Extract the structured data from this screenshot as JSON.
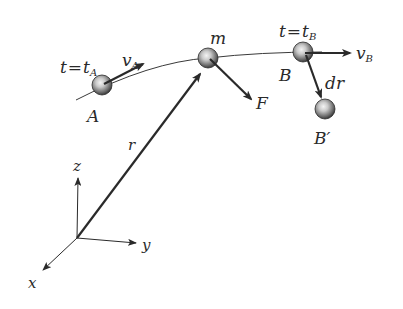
{
  "diagram": {
    "type": "particle-trajectory",
    "colors": {
      "background": "#ffffff",
      "ink": "#2a2a2a",
      "ball_dark": "#3a3a3a",
      "ball_light": "#e8e8e8"
    },
    "labels": {
      "time_a_lhs": "t",
      "time_a_eq": "=",
      "time_a_rhs": "t",
      "time_a_sub": "A",
      "velocity_a": "v",
      "velocity_a_sub": "A",
      "point_a": "A",
      "mass": "m",
      "force": "F",
      "time_b_lhs": "t",
      "time_b_eq": "=",
      "time_b_rhs": "t",
      "time_b_sub": "B",
      "velocity_b": "v",
      "velocity_b_sub": "B",
      "point_b": "B",
      "displacement": "dr",
      "point_b_prime": "B′",
      "position_vector": "r",
      "axis_x": "x",
      "axis_y": "y",
      "axis_z": "z"
    },
    "points": [
      {
        "name": "A",
        "x": 102,
        "y": 85
      },
      {
        "name": "m",
        "x": 208,
        "y": 58
      },
      {
        "name": "B",
        "x": 303,
        "y": 52
      },
      {
        "name": "B′",
        "x": 325,
        "y": 109
      }
    ],
    "origin": {
      "x": 77,
      "y": 238
    }
  }
}
